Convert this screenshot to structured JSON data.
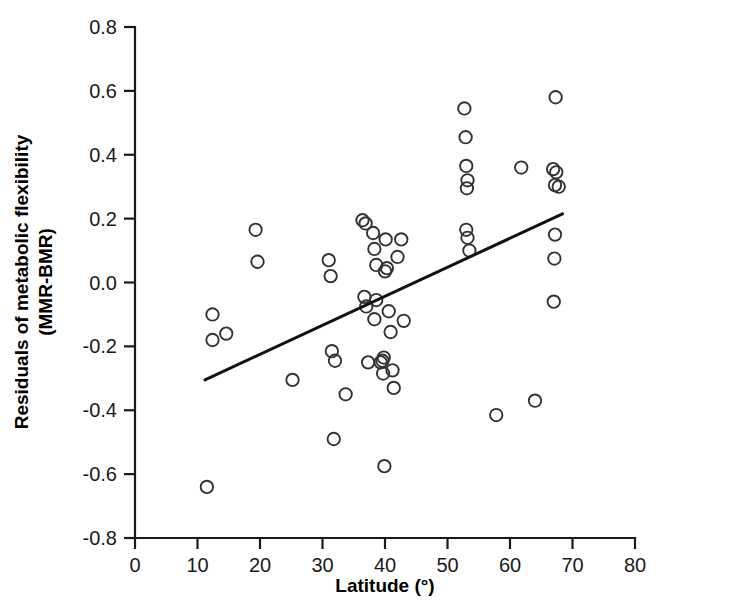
{
  "chart_data": {
    "type": "scatter",
    "title": "",
    "xlabel": "Latitude (°)",
    "ylabel": "Residuals of metabolic flexibility (MMR-BMR)",
    "ylabel_line1": "Residuals of metabolic flexibility",
    "ylabel_line2": "(MMR-BMR)",
    "xlim": [
      0,
      80
    ],
    "ylim": [
      -0.8,
      0.8
    ],
    "xticks": [
      0,
      10,
      20,
      30,
      40,
      50,
      60,
      70,
      80
    ],
    "yticks": [
      -0.8,
      -0.6,
      -0.4,
      -0.2,
      0.0,
      0.2,
      0.4,
      0.6,
      0.8
    ],
    "xtick_labels": [
      "0",
      "10",
      "20",
      "30",
      "40",
      "50",
      "60",
      "70",
      "80"
    ],
    "ytick_labels": [
      "-0.8",
      "-0.6",
      "-0.4",
      "-0.2",
      "0.0",
      "0.2",
      "0.4",
      "0.6",
      "0.8"
    ],
    "grid": false,
    "legend": null,
    "marker": "open-circle",
    "marker_color": "#333333",
    "point_count": 56,
    "points": [
      {
        "x": 11.5,
        "y": -0.64
      },
      {
        "x": 12.4,
        "y": -0.1
      },
      {
        "x": 12.4,
        "y": -0.18
      },
      {
        "x": 14.6,
        "y": -0.16
      },
      {
        "x": 19.3,
        "y": 0.165
      },
      {
        "x": 19.6,
        "y": 0.065
      },
      {
        "x": 25.2,
        "y": -0.305
      },
      {
        "x": 31.0,
        "y": 0.07
      },
      {
        "x": 31.3,
        "y": 0.02
      },
      {
        "x": 31.5,
        "y": -0.215
      },
      {
        "x": 32.0,
        "y": -0.245
      },
      {
        "x": 31.8,
        "y": -0.49
      },
      {
        "x": 33.7,
        "y": -0.35
      },
      {
        "x": 36.4,
        "y": 0.195
      },
      {
        "x": 36.9,
        "y": 0.185
      },
      {
        "x": 36.7,
        "y": -0.045
      },
      {
        "x": 37.0,
        "y": -0.075
      },
      {
        "x": 37.3,
        "y": -0.25
      },
      {
        "x": 38.1,
        "y": 0.155
      },
      {
        "x": 38.3,
        "y": 0.105
      },
      {
        "x": 38.6,
        "y": 0.055
      },
      {
        "x": 38.6,
        "y": -0.055
      },
      {
        "x": 38.3,
        "y": -0.115
      },
      {
        "x": 39.3,
        "y": -0.25
      },
      {
        "x": 39.6,
        "y": -0.245
      },
      {
        "x": 39.8,
        "y": -0.235
      },
      {
        "x": 39.7,
        "y": -0.285
      },
      {
        "x": 39.9,
        "y": -0.575
      },
      {
        "x": 40.1,
        "y": 0.135
      },
      {
        "x": 40.0,
        "y": 0.035
      },
      {
        "x": 40.3,
        "y": 0.045
      },
      {
        "x": 40.6,
        "y": -0.09
      },
      {
        "x": 40.9,
        "y": -0.155
      },
      {
        "x": 41.2,
        "y": -0.275
      },
      {
        "x": 41.4,
        "y": -0.33
      },
      {
        "x": 42.0,
        "y": 0.08
      },
      {
        "x": 42.6,
        "y": 0.135
      },
      {
        "x": 43.0,
        "y": -0.12
      },
      {
        "x": 52.7,
        "y": 0.545
      },
      {
        "x": 52.9,
        "y": 0.455
      },
      {
        "x": 53.0,
        "y": 0.365
      },
      {
        "x": 53.2,
        "y": 0.32
      },
      {
        "x": 53.1,
        "y": 0.295
      },
      {
        "x": 53.0,
        "y": 0.165
      },
      {
        "x": 53.2,
        "y": 0.14
      },
      {
        "x": 53.5,
        "y": 0.1
      },
      {
        "x": 57.8,
        "y": -0.415
      },
      {
        "x": 61.8,
        "y": 0.36
      },
      {
        "x": 64.0,
        "y": -0.37
      },
      {
        "x": 66.9,
        "y": 0.355
      },
      {
        "x": 67.4,
        "y": 0.345
      },
      {
        "x": 67.2,
        "y": 0.305
      },
      {
        "x": 67.8,
        "y": 0.3
      },
      {
        "x": 67.3,
        "y": 0.58
      },
      {
        "x": 67.2,
        "y": 0.15
      },
      {
        "x": 67.1,
        "y": 0.075
      },
      {
        "x": 67.0,
        "y": -0.06
      }
    ],
    "trend_line": {
      "x1": 11.2,
      "y1": -0.305,
      "x2": 68.4,
      "y2": 0.215,
      "color": "#111111"
    }
  }
}
